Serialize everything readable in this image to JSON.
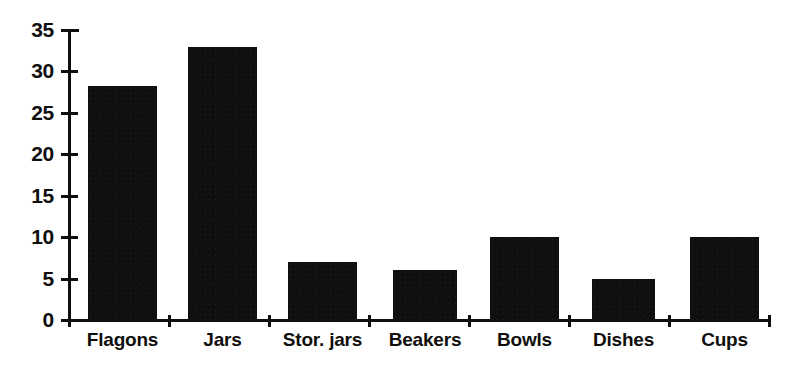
{
  "chart_data": {
    "type": "bar",
    "title": "",
    "subtitle": "",
    "xlabel": "",
    "ylabel": "",
    "categories": [
      "Flagons",
      "Jars",
      "Stor. jars",
      "Beakers",
      "Bowls",
      "Dishes",
      "Cups"
    ],
    "values": [
      28.3,
      33,
      7,
      6,
      10,
      5,
      10
    ],
    "ylim": [
      0,
      35
    ],
    "ytick_labels": [
      "0",
      "5",
      "10",
      "15",
      "20",
      "25",
      "30",
      "35"
    ],
    "ytick_values": [
      0,
      5,
      10,
      15,
      20,
      25,
      30,
      35
    ],
    "grid": false,
    "legend": null,
    "legend_position": "none",
    "bar_color": "#100f0d",
    "background_color": "#ffffff",
    "axis_color": "#100f0d",
    "annotations": []
  },
  "bars": [
    {
      "label": "Flagons",
      "value": 28.3,
      "x": 88,
      "width": 69
    },
    {
      "label": "Jars",
      "value": 33,
      "x": 188,
      "width": 69
    },
    {
      "label": "Stor. jars",
      "value": 7,
      "x": 288,
      "width": 69
    },
    {
      "label": "Beakers",
      "value": 6,
      "x": 393,
      "width": 64
    },
    {
      "label": "Bowls",
      "value": 10,
      "x": 490,
      "width": 69
    },
    {
      "label": "Dishes",
      "value": 5,
      "x": 592,
      "width": 63
    },
    {
      "label": "Cups",
      "value": 10,
      "x": 690,
      "width": 69
    }
  ],
  "y_axis": {
    "ticks": [
      {
        "label": "35",
        "value": 35
      },
      {
        "label": "30",
        "value": 30
      },
      {
        "label": "25",
        "value": 25
      },
      {
        "label": "20",
        "value": 20
      },
      {
        "label": "15",
        "value": 15
      },
      {
        "label": "10",
        "value": 10
      },
      {
        "label": "5",
        "value": 5
      },
      {
        "label": "0",
        "value": 0
      }
    ]
  },
  "x_axis": {
    "tick_positions": [
      68,
      168,
      268,
      368,
      468,
      568,
      668,
      768
    ],
    "labels": [
      "Flagons",
      "Jars",
      "Stor. jars",
      "Beakers",
      "Bowls",
      "Dishes",
      "Cups"
    ]
  }
}
